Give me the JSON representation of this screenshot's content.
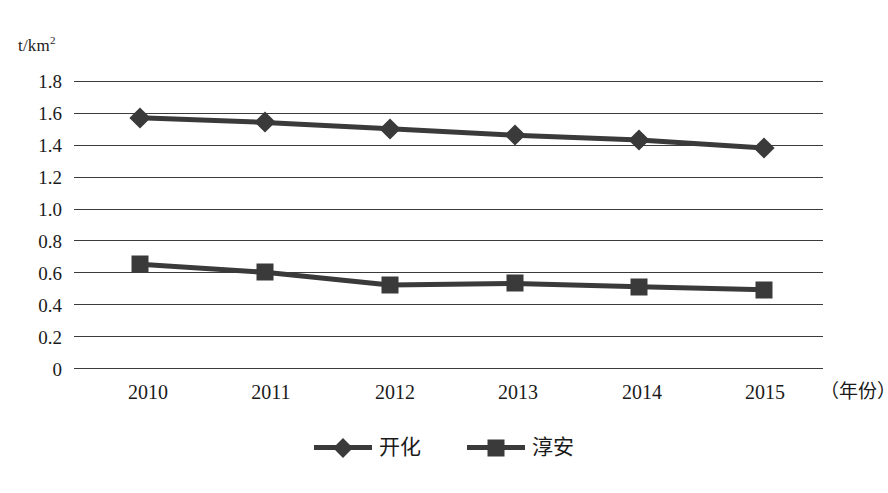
{
  "chart_data": {
    "type": "line",
    "title": "",
    "subtitle": "",
    "xlabel": "（年份）",
    "ylabel": "t/km2",
    "ylabel_base": "t/km",
    "ylabel_sup": "2",
    "categories": [
      "2010",
      "2011",
      "2012",
      "2013",
      "2014",
      "2015"
    ],
    "x": [
      2010,
      2011,
      2012,
      2013,
      2014,
      2015
    ],
    "series": [
      {
        "name": "开化",
        "marker": "diamond",
        "color": "#3a3a3a",
        "values": [
          1.57,
          1.54,
          1.5,
          1.46,
          1.43,
          1.38
        ]
      },
      {
        "name": "淳安",
        "marker": "square",
        "color": "#3a3a3a",
        "values": [
          0.65,
          0.6,
          0.52,
          0.53,
          0.51,
          0.49
        ]
      }
    ],
    "ylim": [
      0,
      1.8
    ],
    "ytick_labels": [
      "1.8",
      "1.6",
      "1.4",
      "1.2",
      "1.0",
      "0.8",
      "0.6",
      "0.4",
      "0.2",
      "0"
    ],
    "ytick_values": [
      1.8,
      1.6,
      1.4,
      1.2,
      1.0,
      0.8,
      0.6,
      0.4,
      0.2,
      0
    ],
    "grid": true,
    "grid_axis": "y",
    "legend_position": "bottom",
    "background_color": "#ffffff",
    "line_color": "#3a3a3a",
    "grid_color": "#3b3b3b"
  },
  "legend": {
    "items": [
      {
        "label": "开化",
        "marker": "diamond"
      },
      {
        "label": "淳安",
        "marker": "square"
      }
    ]
  }
}
